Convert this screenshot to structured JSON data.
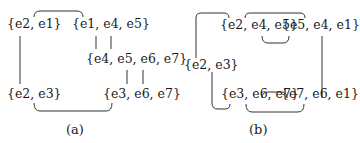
{
  "diagram_a": {
    "caption": "(a)",
    "nodes": {
      "n1": "{e2, e1}",
      "n2": "{e1, e4, e5}",
      "n3": "{e4, e5, e6, e7}",
      "n4": "{e2, e3}",
      "n5": "{e3, e6, e7}"
    },
    "edges": [
      [
        "n1",
        "n2",
        "e1"
      ],
      [
        "n2",
        "n3",
        "e4"
      ],
      [
        "n2",
        "n3",
        "e5"
      ],
      [
        "n3",
        "n5",
        "e6"
      ],
      [
        "n3",
        "n5",
        "e7"
      ],
      [
        "n1",
        "n4",
        "e2"
      ],
      [
        "n4",
        "n5",
        "e3"
      ]
    ]
  },
  "diagram_b": {
    "caption": "(b)",
    "nodes": {
      "n1": "{e2, e3}",
      "n2": "{e2, e4, e5}",
      "n3": "{e5, e4, e1}",
      "n4": "{e3, e6, e7}",
      "n5": "{e7, e6, e1}"
    },
    "edges": [
      [
        "n1",
        "n2",
        "e2"
      ],
      [
        "n2",
        "n3",
        "e4"
      ],
      [
        "n2",
        "n3",
        "e5"
      ],
      [
        "n3",
        "n5",
        "e1"
      ],
      [
        "n1",
        "n4",
        "e3"
      ],
      [
        "n4",
        "n5",
        "e6"
      ],
      [
        "n4",
        "n5",
        "e7"
      ]
    ]
  }
}
